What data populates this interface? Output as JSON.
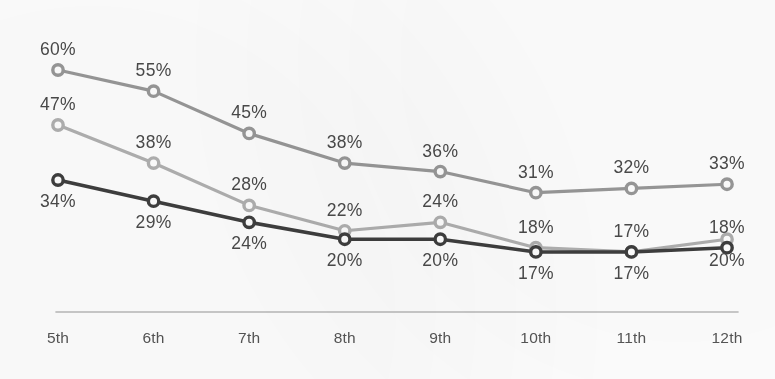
{
  "chart_data": {
    "type": "line",
    "title": "",
    "subtitle": "",
    "xlabel": "",
    "ylabel": "",
    "categories": [
      "5th",
      "6th",
      "7th",
      "8th",
      "9th",
      "10th",
      "11th",
      "12th"
    ],
    "value_suffix": "%",
    "ylim": [
      0,
      65
    ],
    "grid": false,
    "legend_position": "none",
    "axis_line_color": "#b9b9b9",
    "background_color": "#fefefe",
    "label_color": "#4a4a4a",
    "tick_label_color": "#555555",
    "series": [
      {
        "name": "series-top",
        "color": "#989898",
        "label_position": "above",
        "values": [
          60,
          55,
          45,
          38,
          36,
          31,
          32,
          33
        ],
        "labels": [
          "60%",
          "55%",
          "45%",
          "38%",
          "36%",
          "31%",
          "32%",
          "33%"
        ]
      },
      {
        "name": "series-middle",
        "color": "#b0b0b0",
        "label_position": "above",
        "values": [
          47,
          38,
          28,
          22,
          24,
          18,
          17,
          20
        ],
        "labels": [
          "47%",
          "38%",
          "28%",
          "22%",
          "24%",
          "18%",
          "17%",
          "20%"
        ],
        "label_overrides": [
          {
            "index": 7,
            "position": "below"
          }
        ]
      },
      {
        "name": "series-bottom",
        "color": "#3e3e3e",
        "label_position": "below",
        "values": [
          34,
          29,
          24,
          20,
          20,
          17,
          17,
          18
        ],
        "labels": [
          "34%",
          "29%",
          "24%",
          "20%",
          "20%",
          "17%",
          "17%",
          "18%"
        ],
        "label_overrides": [
          {
            "index": 7,
            "position": "above"
          }
        ]
      }
    ]
  }
}
